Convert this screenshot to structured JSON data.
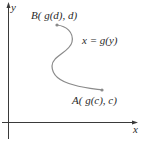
{
  "figure": {
    "axes": {
      "x_label": "x",
      "y_label": "y"
    },
    "curve": {
      "equation_label": "x = g(y)",
      "color": "#8a8a8a"
    },
    "points": {
      "B": {
        "label": "B( g(d), d)"
      },
      "A": {
        "label": "A( g(c), c)"
      }
    },
    "colors": {
      "axis": "#3a3a3a",
      "text": "#2a2a2a",
      "curve": "#8a8a8a",
      "point": "#8a8a8a"
    }
  }
}
